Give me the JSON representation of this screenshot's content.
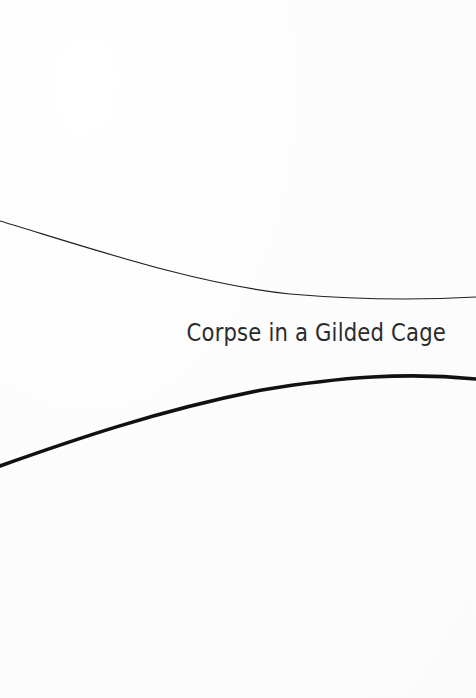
{
  "page": {
    "width": 476,
    "height": 698,
    "background_color": "#fdfdfd",
    "kind": "book-title-page"
  },
  "title": {
    "text": "Corpse in a Gilded Cage",
    "color": "#2b2b2b",
    "font_size_px": 25,
    "alignment": "right"
  },
  "decorations": {
    "thin_rule": {
      "name": "upper-thin-curve",
      "color": "#1f1f1f",
      "stroke_width": 1.1,
      "path": "M 0 221 C 96 250, 196 284, 290 294 C 360 300, 424 300, 476 297"
    },
    "thick_rule": {
      "name": "lower-thick-curve",
      "color": "#111111",
      "stroke_width": 3.6,
      "path": "M 0 466 C 70 441, 160 410, 262 390 C 340 377, 406 372, 476 379"
    }
  }
}
